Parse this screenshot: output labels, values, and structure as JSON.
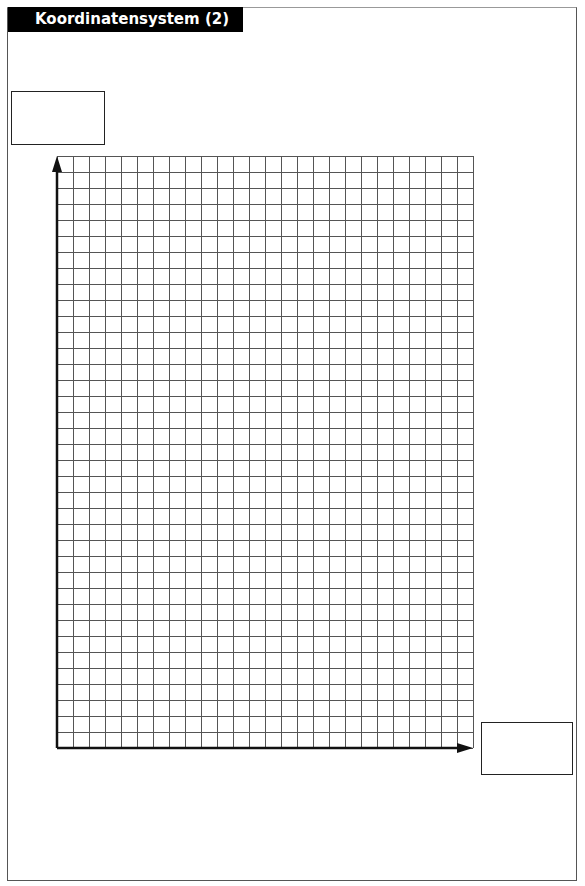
{
  "title": "Koordinatensystem (2)",
  "worksheet": {
    "y_axis_label_box": "",
    "x_axis_label_box": "",
    "grid": {
      "columns": 26,
      "rows": 37,
      "cell_size_px": 16,
      "origin": "bottom-left",
      "x_axis_arrow": "right",
      "y_axis_arrow": "up"
    }
  },
  "colors": {
    "title_bg": "#000000",
    "title_fg": "#ffffff",
    "grid_line": "#555555",
    "axis": "#111111"
  }
}
